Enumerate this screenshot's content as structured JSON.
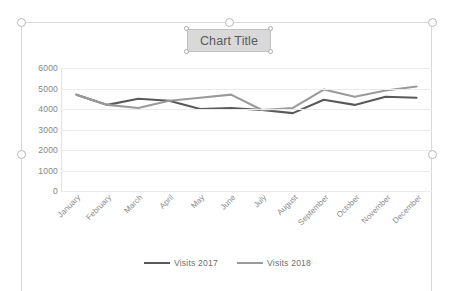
{
  "app": {
    "context": "spreadsheet-chart-object-selected"
  },
  "chart": {
    "title": "Chart Title",
    "title_selected": true
  },
  "legend": {
    "position": "bottom",
    "items": [
      {
        "label": "Visits 2017",
        "color": "#595959"
      },
      {
        "label": "Visits 2018",
        "color": "#9a9a9a"
      }
    ]
  },
  "colors": {
    "series_2017": "#595959",
    "series_2018": "#9a9a9a",
    "gridline": "#eceaea",
    "tick_text": "#868686",
    "frame": "#d8d8d8",
    "title_fill": "#d9d9d9"
  },
  "chart_data": {
    "type": "line",
    "title": "Chart Title",
    "xlabel": "",
    "ylabel": "",
    "ylim": [
      0,
      6000
    ],
    "ytick_values": [
      6000,
      5000,
      4000,
      3000,
      2000,
      1000,
      0
    ],
    "ytick_labels": [
      "6000",
      "5000",
      "4000",
      "3000",
      "2000",
      "1000",
      "0"
    ],
    "grid": true,
    "legend_position": "bottom",
    "categories": [
      "January",
      "February",
      "March",
      "April",
      "May",
      "June",
      "July",
      "August",
      "September",
      "October",
      "November",
      "December"
    ],
    "series": [
      {
        "name": "Visits 2017",
        "color": "#595959",
        "values": [
          4700,
          4200,
          4500,
          4400,
          4000,
          4050,
          3950,
          3800,
          4450,
          4200,
          4600,
          4550
        ]
      },
      {
        "name": "Visits 2018",
        "color": "#9a9a9a",
        "values": [
          4700,
          4200,
          4050,
          4400,
          4550,
          4700,
          3950,
          4050,
          4950,
          4600,
          4900,
          5100
        ]
      }
    ]
  }
}
